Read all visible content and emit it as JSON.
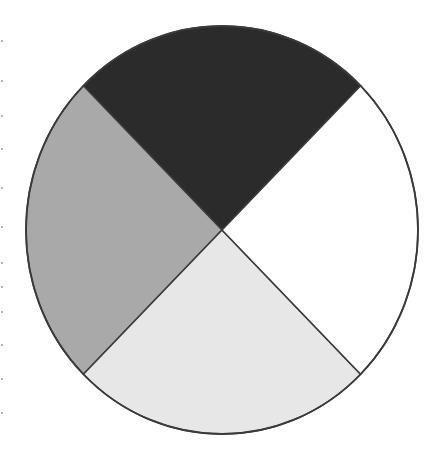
{
  "chart_data": {
    "type": "pie",
    "title": "",
    "legend": null,
    "labels_visible": false,
    "slices": [
      {
        "name": "slice-top",
        "value": 25,
        "color": "#2b2b2b",
        "start_angle_deg": 45,
        "end_angle_deg": 135
      },
      {
        "name": "slice-left",
        "value": 25,
        "color": "#a9a9a9",
        "start_angle_deg": 135,
        "end_angle_deg": 225
      },
      {
        "name": "slice-bottom",
        "value": 25,
        "color": "#e7e7e7",
        "start_angle_deg": 225,
        "end_angle_deg": 315
      },
      {
        "name": "slice-right",
        "value": 25,
        "color": "#ffffff",
        "start_angle_deg": 315,
        "end_angle_deg": 405
      }
    ],
    "values": [
      25,
      25,
      25,
      25
    ],
    "categories": [
      "",
      "",
      "",
      ""
    ],
    "outline_color": "#3a3a3a",
    "geometry": {
      "cx": 222,
      "cy": 230,
      "rx": 196,
      "ry": 204
    }
  }
}
